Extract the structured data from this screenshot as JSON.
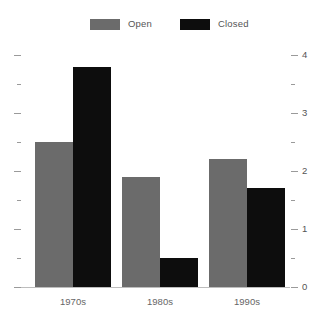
{
  "chart_data": {
    "type": "bar",
    "title": "",
    "subtitle": "",
    "xlabel": "",
    "ylabel": "",
    "categories": [
      "1970s",
      "1980s",
      "1990s"
    ],
    "series": [
      {
        "name": "Open",
        "color": "#6b6b6b",
        "values": [
          2.5,
          1.9,
          2.2
        ]
      },
      {
        "name": "Closed",
        "color": "#0d0d0d",
        "values": [
          3.8,
          0.5,
          1.7
        ]
      }
    ],
    "ylim": [
      0,
      4.3
    ],
    "y_major_ticks": [
      0,
      1,
      2,
      3,
      4
    ],
    "y_major_tick_labels": [
      "0",
      "1",
      "2",
      "3",
      "4"
    ],
    "y_minor_ticks": [
      0.5,
      1.5,
      2.5,
      3.5
    ],
    "grid": false,
    "legend_position": "top-center",
    "axis_labels_side": "right",
    "left_axis_ticks_only": true
  },
  "legend": {
    "entries": [
      {
        "label": "Open",
        "swatch": "legend-swatch-open",
        "x": 90
      },
      {
        "label": "Closed",
        "swatch": "legend-swatch-closed",
        "x": 180
      }
    ]
  },
  "colors": {
    "open": "#6b6b6b",
    "closed": "#0d0d0d",
    "axis": "#9a9a9a",
    "baseline": "#bdbdbd",
    "label_text": "#555555",
    "category_text": "#666666",
    "background": "#ffffff"
  }
}
